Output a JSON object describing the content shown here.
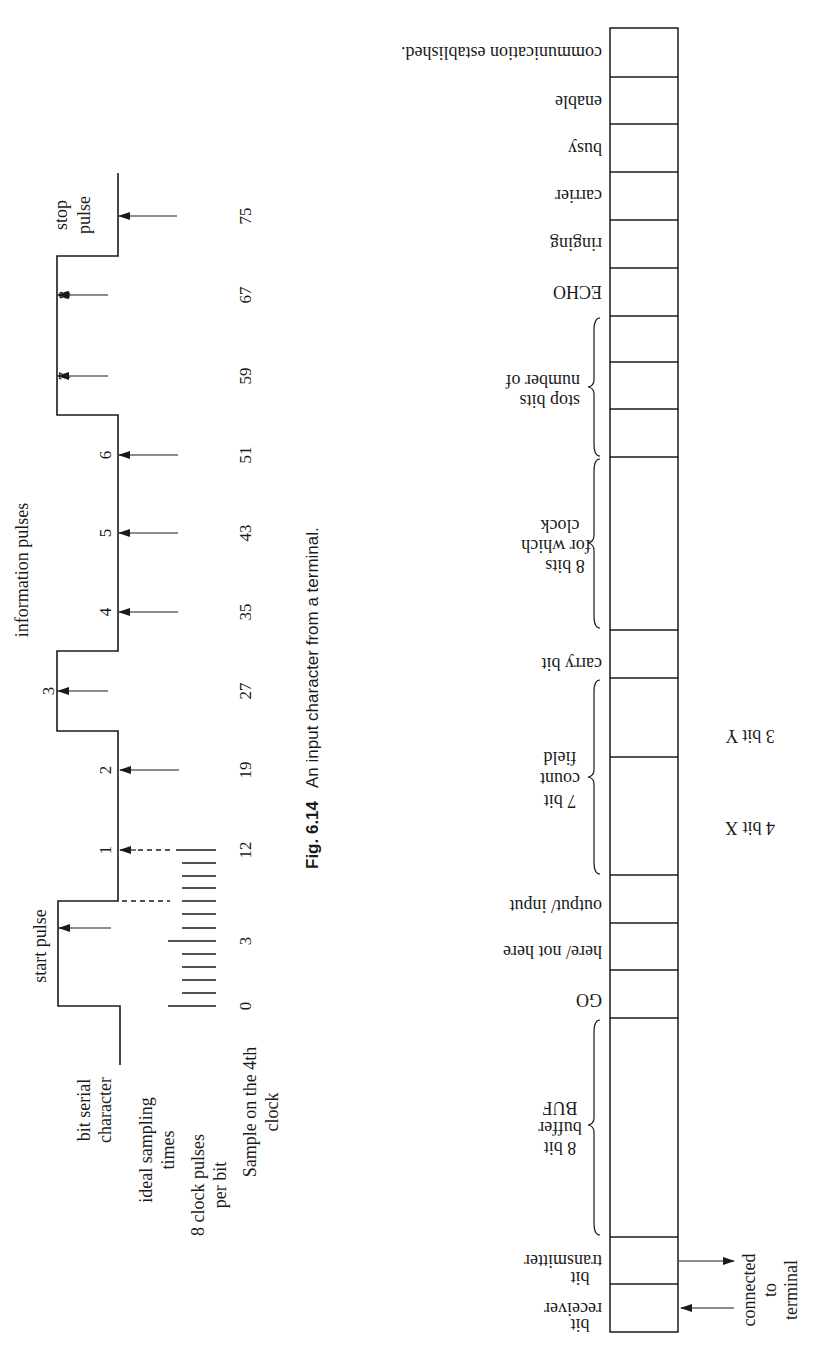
{
  "caption": {
    "figure": "Fig. 6.14",
    "text": "An input character from a terminal."
  },
  "waveform": {
    "row_labels": {
      "bit_serial": [
        "bit serial",
        "character"
      ],
      "ideal_sampling": [
        "ideal sampling",
        "times"
      ],
      "clock_pulses": [
        "8 clock pulses",
        "per bit"
      ],
      "sample_clock": [
        "Sample on the 4th",
        "clock"
      ]
    },
    "start_pulse_label": "start pulse",
    "information_pulses_label": "information pulses",
    "stop_pulse_label": [
      "stop",
      "pulse"
    ],
    "bits": [
      {
        "label": "1",
        "sample": "12"
      },
      {
        "label": "2",
        "sample": "19"
      },
      {
        "label": "3",
        "sample": "27"
      },
      {
        "label": "4",
        "sample": "35"
      },
      {
        "label": "5",
        "sample": "43"
      },
      {
        "label": "6",
        "sample": "51"
      },
      {
        "label": "7",
        "sample": "59"
      },
      {
        "label": "8",
        "sample": "67"
      }
    ],
    "start_sample": "3",
    "stop_sample": "75",
    "clock_origin": "0"
  },
  "register": {
    "fields": [
      {
        "label": [
          "communication established."
        ]
      },
      {
        "label": [
          "enable"
        ]
      },
      {
        "label": [
          "busy"
        ]
      },
      {
        "label": [
          "carrier"
        ]
      },
      {
        "label": [
          "ringing"
        ]
      },
      {
        "label": [
          "ECHO"
        ]
      },
      {
        "label": [
          ""
        ]
      },
      {
        "label": [
          ""
        ]
      },
      {
        "label": [
          ""
        ]
      },
      {
        "label": [
          ""
        ]
      },
      {
        "label": [
          "carry bit"
        ]
      },
      {
        "label": [
          ""
        ]
      },
      {
        "label": [
          ""
        ]
      },
      {
        "label": [
          "output/ input"
        ]
      },
      {
        "label": [
          "here/ not here"
        ]
      },
      {
        "label": [
          "GO"
        ]
      },
      {
        "label": [
          ""
        ]
      },
      {
        "label": [
          "transmitter",
          "bit"
        ]
      },
      {
        "label": [
          "receiver",
          "bit"
        ]
      }
    ],
    "groups": {
      "stop_bits": [
        "number of",
        "stop bits"
      ],
      "clock_bits": [
        "8 bits",
        "for which",
        "clock"
      ],
      "count_field": [
        "7 bit",
        "count",
        "field"
      ],
      "buffer": [
        "8 bit",
        "buffer",
        "BUF"
      ]
    },
    "subfields": {
      "y": "3 bit Y",
      "x": "4 bit X"
    },
    "terminal_label": [
      "connected",
      "to",
      "terminal"
    ]
  }
}
